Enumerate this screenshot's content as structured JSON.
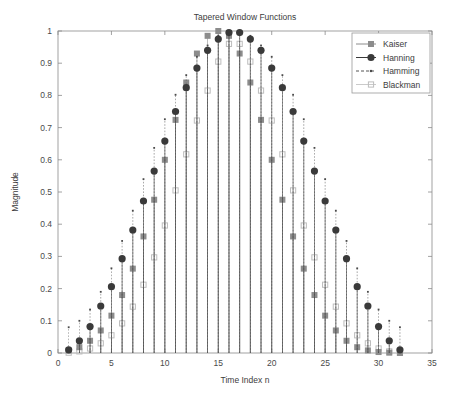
{
  "chart_data": {
    "type": "line",
    "title": "Tapered Window Functions",
    "xlabel": "Time Index n",
    "ylabel": "Magnitude",
    "xlim": [
      0,
      35
    ],
    "ylim": [
      0,
      1
    ],
    "xticks": [
      0,
      5,
      10,
      15,
      20,
      25,
      30,
      35
    ],
    "yticks": [
      0,
      0.1,
      0.2,
      0.3,
      0.4,
      0.5,
      0.6,
      0.7,
      0.8,
      0.9,
      1
    ],
    "grid": false,
    "legend_position": "top-right",
    "x": [
      1,
      2,
      3,
      4,
      5,
      6,
      7,
      8,
      9,
      10,
      11,
      12,
      13,
      14,
      15,
      16,
      17,
      18,
      19,
      20,
      21,
      22,
      23,
      24,
      25,
      26,
      27,
      28,
      29,
      30,
      31,
      32
    ],
    "series": [
      {
        "name": "Kaiser",
        "marker": "square",
        "color": "#8c8c8c",
        "values": [
          0.008,
          0.018,
          0.038,
          0.07,
          0.116,
          0.18,
          0.262,
          0.362,
          0.476,
          0.6,
          0.724,
          0.84,
          0.93,
          0.985,
          1.0,
          0.985,
          0.93,
          0.84,
          0.724,
          0.6,
          0.476,
          0.362,
          0.262,
          0.18,
          0.116,
          0.07,
          0.038,
          0.018,
          0.008,
          0.003,
          0.001,
          0.0
        ]
      },
      {
        "name": "Hanning",
        "marker": "circle",
        "color": "#3a3a3a",
        "values": [
          0.01,
          0.038,
          0.082,
          0.146,
          0.206,
          0.293,
          0.382,
          0.472,
          0.565,
          0.658,
          0.75,
          0.824,
          0.885,
          0.94,
          0.975,
          0.995,
          0.995,
          0.975,
          0.94,
          0.885,
          0.824,
          0.75,
          0.658,
          0.565,
          0.472,
          0.382,
          0.293,
          0.206,
          0.146,
          0.082,
          0.038,
          0.01
        ]
      },
      {
        "name": "Hamming",
        "marker": "dot",
        "color": "#555555",
        "values": [
          0.08,
          0.1,
          0.135,
          0.19,
          0.263,
          0.348,
          0.442,
          0.54,
          0.637,
          0.726,
          0.802,
          0.863,
          0.92,
          0.955,
          0.985,
          1.0,
          1.0,
          0.985,
          0.955,
          0.92,
          0.863,
          0.802,
          0.726,
          0.637,
          0.54,
          0.442,
          0.348,
          0.263,
          0.19,
          0.135,
          0.1,
          0.08
        ]
      },
      {
        "name": "Blackman",
        "marker": "square-open",
        "color": "#bdbdbd",
        "values": [
          0.001,
          0.005,
          0.014,
          0.03,
          0.055,
          0.092,
          0.144,
          0.212,
          0.297,
          0.396,
          0.505,
          0.617,
          0.722,
          0.815,
          0.905,
          0.96,
          0.96,
          0.905,
          0.815,
          0.722,
          0.617,
          0.505,
          0.396,
          0.297,
          0.212,
          0.144,
          0.092,
          0.055,
          0.03,
          0.014,
          0.005,
          0.001
        ]
      }
    ]
  }
}
